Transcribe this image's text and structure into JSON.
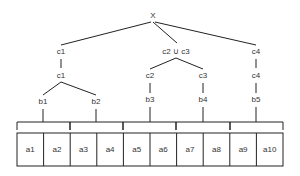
{
  "root": {
    "label": "X"
  },
  "level1": [
    {
      "label": "c1"
    },
    {
      "label": "c2 ∪ c3"
    },
    {
      "label": "c4"
    }
  ],
  "level2": [
    {
      "label": "c1"
    },
    {
      "label": "c2"
    },
    {
      "label": "c3"
    },
    {
      "label": "c4"
    }
  ],
  "level3": [
    {
      "label": "b1"
    },
    {
      "label": "b2"
    },
    {
      "label": "b3"
    },
    {
      "label": "b4"
    },
    {
      "label": "b5"
    }
  ],
  "leaves": [
    {
      "label": "a1"
    },
    {
      "label": "a2"
    },
    {
      "label": "a3"
    },
    {
      "label": "a4"
    },
    {
      "label": "a5"
    },
    {
      "label": "a6"
    },
    {
      "label": "a7"
    },
    {
      "label": "a8"
    },
    {
      "label": "a9"
    },
    {
      "label": "a10"
    }
  ],
  "colors": {
    "line": "#222222",
    "text": "#333333",
    "background": "#ffffff"
  }
}
